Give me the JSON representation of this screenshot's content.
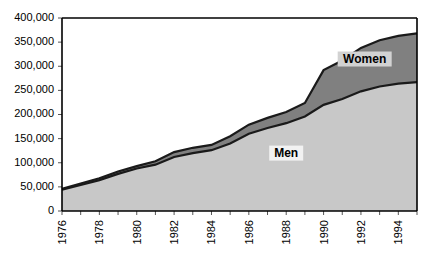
{
  "chart_data": {
    "type": "area",
    "stacked": true,
    "title": "",
    "xlabel": "",
    "ylabel": "",
    "ylim": [
      0,
      400000
    ],
    "ytick_labels": [
      "400,000",
      "350,000",
      "300,000",
      "250,000",
      "200,000",
      "150,000",
      "100,000",
      "50,000",
      "0"
    ],
    "ytick_values": [
      400000,
      350000,
      300000,
      250000,
      200000,
      150000,
      100000,
      50000,
      0
    ],
    "grid": false,
    "legend_position": "inside-plot",
    "x": [
      1976,
      1977,
      1978,
      1979,
      1980,
      1981,
      1982,
      1983,
      1984,
      1985,
      1986,
      1987,
      1988,
      1989,
      1990,
      1991,
      1992,
      1993,
      1994,
      1995
    ],
    "xtick_labels": [
      "1976",
      "1978",
      "1980",
      "1982",
      "1984",
      "1986",
      "1988",
      "1990",
      "1992",
      "1994"
    ],
    "xtick_label_values": [
      1976,
      1978,
      1980,
      1982,
      1984,
      1986,
      1988,
      1990,
      1992,
      1994
    ],
    "series": [
      {
        "name": "Men",
        "color": "#c8c8c8",
        "values": [
          44000,
          54000,
          64000,
          77000,
          88000,
          96000,
          112000,
          120000,
          126000,
          140000,
          160000,
          172000,
          182000,
          196000,
          220000,
          232000,
          248000,
          258000,
          264000,
          267000
        ]
      },
      {
        "name": "Women",
        "color": "#808080",
        "values": [
          2000,
          3000,
          4000,
          5000,
          5000,
          7000,
          10000,
          11000,
          11000,
          15000,
          19000,
          21000,
          23000,
          28000,
          72000,
          80000,
          90000,
          96000,
          99000,
          101000
        ]
      }
    ],
    "totals": [
      46000,
      57000,
      68000,
      82000,
      93000,
      103000,
      122000,
      131000,
      137000,
      155000,
      179000,
      193000,
      205000,
      224000,
      292000,
      312000,
      338000,
      354000,
      363000,
      368000
    ],
    "annotations": [
      {
        "text": "Women",
        "x": 1992.2,
        "y": 315000
      },
      {
        "text": "Men",
        "x": 1988.0,
        "y": 120000
      }
    ]
  }
}
